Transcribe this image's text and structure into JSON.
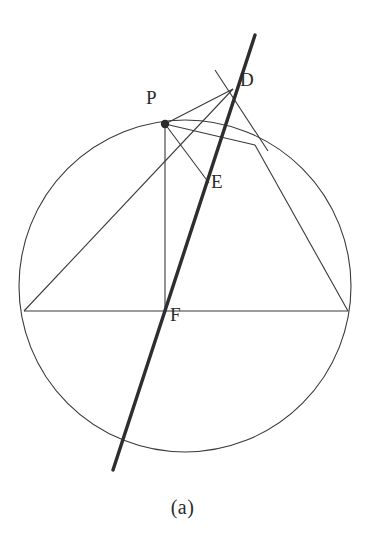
{
  "figure": {
    "caption": "(a)",
    "background_color": "#ffffff",
    "stroke_color": "#3a3a3a",
    "thick_stroke_color": "#2e2e2e",
    "label_color": "#2b2b2b",
    "width": 365,
    "height": 547
  },
  "labels": {
    "p": "P",
    "d": "D",
    "e": "E",
    "f": "F"
  },
  "label_positions": {
    "p": {
      "x": 146,
      "y": 96
    },
    "d": {
      "x": 240,
      "y": 78
    },
    "e": {
      "x": 211,
      "y": 180
    },
    "f": {
      "x": 170,
      "y": 313
    }
  },
  "chart_data": {
    "type": "diagram",
    "title": "(a)",
    "circle": {
      "center": {
        "x": 185,
        "y": 286
      },
      "radius": 166,
      "stroke_width": 1.1
    },
    "points": [
      {
        "name": "P",
        "x": 165,
        "y": 124,
        "marker": "filled-dot",
        "radius": 4.2,
        "on_circle": true
      },
      {
        "name": "D",
        "x": 233,
        "y": 89,
        "marker": "none",
        "on_circle": false
      },
      {
        "name": "E",
        "x": 207,
        "y": 180,
        "marker": "none",
        "on_circle": false
      },
      {
        "name": "F",
        "x": 165,
        "y": 311,
        "marker": "none",
        "on_circle": false
      },
      {
        "name": "A",
        "x": 24,
        "y": 311,
        "marker": "none",
        "on_circle": true
      },
      {
        "name": "B",
        "x": 348,
        "y": 311,
        "marker": "none",
        "on_circle": true
      },
      {
        "name": "C",
        "x": 255,
        "y": 145,
        "marker": "none",
        "on_circle": true
      }
    ],
    "segments": [
      {
        "name": "chord-A-B",
        "from": {
          "x": 24,
          "y": 311
        },
        "to": {
          "x": 348,
          "y": 311
        },
        "weight": "thin"
      },
      {
        "name": "chord-A-D",
        "from": {
          "x": 24,
          "y": 311
        },
        "to": {
          "x": 233,
          "y": 89
        },
        "weight": "thin"
      },
      {
        "name": "chord-P-F",
        "from": {
          "x": 165,
          "y": 124
        },
        "to": {
          "x": 165,
          "y": 311
        },
        "weight": "thin"
      },
      {
        "name": "chord-P-D",
        "from": {
          "x": 165,
          "y": 124
        },
        "to": {
          "x": 233,
          "y": 89
        },
        "weight": "thin"
      },
      {
        "name": "chord-P-E",
        "from": {
          "x": 165,
          "y": 124
        },
        "to": {
          "x": 209,
          "y": 183
        },
        "weight": "thin"
      },
      {
        "name": "chord-P-C",
        "from": {
          "x": 165,
          "y": 124
        },
        "to": {
          "x": 255,
          "y": 145
        },
        "weight": "thin"
      },
      {
        "name": "chord-C-B",
        "from": {
          "x": 255,
          "y": 145
        },
        "to": {
          "x": 348,
          "y": 311
        },
        "weight": "thin"
      },
      {
        "name": "segment-D-tangent",
        "from": {
          "x": 215,
          "y": 70
        },
        "to": {
          "x": 268,
          "y": 151
        },
        "weight": "thin"
      },
      {
        "name": "secant-thick",
        "from": {
          "x": 255,
          "y": 35
        },
        "to": {
          "x": 113,
          "y": 470
        },
        "weight": "thick",
        "stroke_width": 3.4
      }
    ],
    "axis_ranges": {
      "x": [
        0,
        365
      ],
      "y": [
        0,
        547
      ]
    },
    "grid": false,
    "legend": null
  }
}
